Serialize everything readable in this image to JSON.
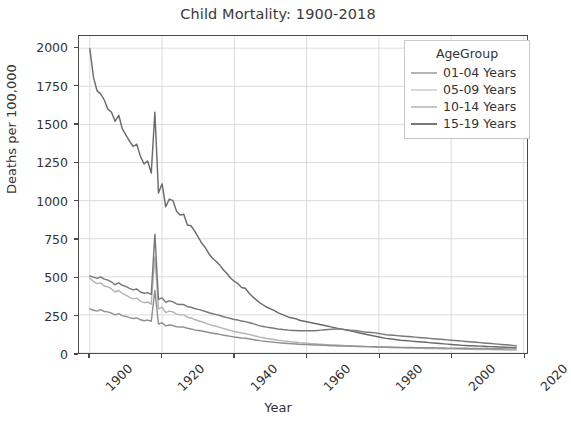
{
  "chart_data": {
    "type": "line",
    "title": "Child Mortality: 1900-2018",
    "xlabel": "Year",
    "ylabel": "Deaths per 100,000",
    "xlim": [
      1897,
      2021
    ],
    "ylim": [
      0,
      2080
    ],
    "xticks": [
      1900,
      1920,
      1940,
      1960,
      1980,
      2000,
      2020
    ],
    "yticks": [
      0,
      250,
      500,
      750,
      1000,
      1250,
      1500,
      1750,
      2000
    ],
    "grid": true,
    "legend_position": "upper right",
    "legend_title": "AgeGroup",
    "x": [
      1900,
      1901,
      1902,
      1903,
      1904,
      1905,
      1906,
      1907,
      1908,
      1909,
      1910,
      1911,
      1912,
      1913,
      1914,
      1915,
      1916,
      1917,
      1918,
      1919,
      1920,
      1921,
      1922,
      1923,
      1924,
      1925,
      1926,
      1927,
      1928,
      1929,
      1930,
      1931,
      1932,
      1933,
      1934,
      1935,
      1936,
      1937,
      1938,
      1939,
      1940,
      1941,
      1942,
      1943,
      1944,
      1945,
      1946,
      1947,
      1948,
      1949,
      1950,
      1951,
      1952,
      1953,
      1954,
      1955,
      1956,
      1957,
      1958,
      1959,
      1960,
      1961,
      1962,
      1963,
      1964,
      1965,
      1966,
      1967,
      1968,
      1969,
      1970,
      1971,
      1972,
      1973,
      1974,
      1975,
      1976,
      1977,
      1978,
      1979,
      1980,
      1981,
      1982,
      1983,
      1984,
      1985,
      1986,
      1987,
      1988,
      1989,
      1990,
      1991,
      1992,
      1993,
      1994,
      1995,
      1996,
      1997,
      1998,
      1999,
      2000,
      2001,
      2002,
      2003,
      2004,
      2005,
      2006,
      2007,
      2008,
      2009,
      2010,
      2011,
      2012,
      2013,
      2014,
      2015,
      2016,
      2017,
      2018
    ],
    "series": [
      {
        "name": "01-04 Years",
        "color": "#6b6b6b",
        "values": [
          1996,
          1810,
          1720,
          1700,
          1660,
          1600,
          1580,
          1520,
          1560,
          1470,
          1430,
          1390,
          1355,
          1370,
          1290,
          1240,
          1260,
          1180,
          1580,
          1050,
          1110,
          960,
          1010,
          1000,
          930,
          905,
          910,
          840,
          835,
          800,
          760,
          720,
          690,
          650,
          620,
          600,
          575,
          545,
          520,
          490,
          470,
          455,
          430,
          425,
          395,
          370,
          350,
          330,
          315,
          300,
          290,
          280,
          265,
          255,
          245,
          235,
          230,
          225,
          215,
          210,
          205,
          200,
          195,
          190,
          185,
          180,
          175,
          170,
          165,
          160,
          155,
          150,
          145,
          140,
          135,
          130,
          125,
          120,
          115,
          110,
          105,
          100,
          96,
          93,
          90,
          87,
          84,
          82,
          80,
          78,
          76,
          74,
          72,
          70,
          68,
          66,
          64,
          62,
          60,
          58,
          56,
          54,
          52,
          50,
          49,
          48,
          47,
          46,
          45,
          44,
          43,
          42,
          41,
          40,
          39,
          38,
          37,
          36,
          35
        ]
      },
      {
        "name": "05-09 Years",
        "color": "#b4b4b4",
        "values": [
          490,
          470,
          455,
          460,
          440,
          435,
          420,
          400,
          410,
          390,
          380,
          365,
          355,
          360,
          340,
          330,
          335,
          320,
          630,
          290,
          300,
          265,
          275,
          270,
          255,
          250,
          250,
          235,
          230,
          220,
          212,
          205,
          196,
          188,
          180,
          175,
          168,
          160,
          154,
          147,
          141,
          136,
          131,
          128,
          122,
          116,
          110,
          104,
          100,
          95,
          92,
          88,
          84,
          81,
          78,
          75,
          73,
          71,
          68,
          66,
          64,
          62,
          61,
          59,
          58,
          56,
          55,
          53,
          52,
          51,
          50,
          48,
          47,
          46,
          45,
          44,
          43,
          42,
          41,
          40,
          39,
          38,
          37,
          36,
          35,
          34,
          34,
          33,
          33,
          32,
          32,
          31,
          31,
          30,
          30,
          29,
          29,
          28,
          28,
          27,
          27,
          26,
          26,
          25,
          25,
          24,
          24,
          23,
          23,
          22,
          22,
          22,
          21,
          21,
          21,
          20,
          20,
          20,
          20
        ]
      },
      {
        "name": "10-14 Years",
        "color": "#8f8f8f",
        "values": [
          290,
          280,
          275,
          285,
          272,
          270,
          262,
          250,
          258,
          245,
          240,
          232,
          226,
          230,
          218,
          212,
          216,
          208,
          410,
          190,
          198,
          178,
          184,
          180,
          172,
          170,
          170,
          162,
          158,
          152,
          148,
          144,
          139,
          134,
          130,
          126,
          122,
          117,
          113,
          109,
          105,
          102,
          99,
          97,
          93,
          89,
          85,
          81,
          78,
          75,
          73,
          70,
          68,
          66,
          64,
          62,
          61,
          59,
          57,
          56,
          55,
          54,
          53,
          52,
          51,
          50,
          49,
          48,
          47,
          46,
          46,
          45,
          44,
          44,
          43,
          43,
          42,
          42,
          41,
          41,
          40,
          40,
          39,
          39,
          38,
          38,
          37,
          37,
          36,
          36,
          35,
          35,
          35,
          34,
          34,
          34,
          33,
          33,
          33,
          32,
          32,
          32,
          31,
          31,
          31,
          30,
          30,
          30,
          29,
          29,
          29,
          28,
          28,
          28,
          28,
          27,
          27,
          27,
          27
        ]
      },
      {
        "name": "15-19 Years",
        "color": "#787878",
        "values": [
          505,
          498,
          490,
          500,
          485,
          478,
          466,
          448,
          460,
          444,
          436,
          424,
          414,
          420,
          400,
          392,
          396,
          384,
          780,
          352,
          362,
          332,
          342,
          336,
          322,
          318,
          318,
          304,
          300,
          292,
          286,
          280,
          272,
          264,
          258,
          252,
          246,
          238,
          232,
          226,
          220,
          216,
          210,
          206,
          200,
          194,
          186,
          178,
          174,
          170,
          166,
          162,
          158,
          156,
          152,
          150,
          148,
          148,
          146,
          146,
          146,
          146,
          146,
          148,
          150,
          152,
          154,
          156,
          158,
          158,
          156,
          152,
          150,
          148,
          146,
          142,
          138,
          136,
          134,
          132,
          128,
          124,
          120,
          118,
          116,
          114,
          112,
          110,
          108,
          106,
          104,
          102,
          100,
          98,
          96,
          94,
          92,
          90,
          88,
          86,
          84,
          82,
          80,
          78,
          76,
          74,
          72,
          70,
          68,
          66,
          64,
          62,
          60,
          58,
          56,
          54,
          52,
          50,
          48
        ]
      }
    ]
  }
}
